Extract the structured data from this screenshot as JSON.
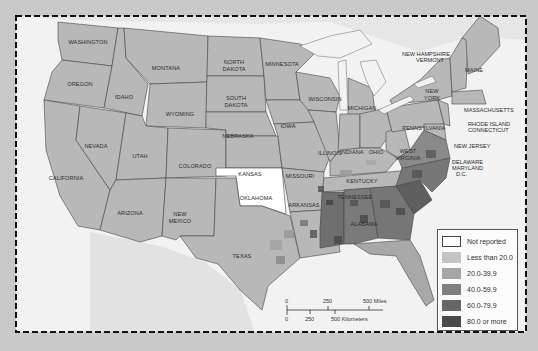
{
  "map": {
    "title": "",
    "background_color": "#c9c9c9",
    "water_color": "#f2f2f2",
    "state_fill": "#b8b8b8",
    "not_reported_fill": "#ffffff",
    "states": {
      "washington": "WASHINGTON",
      "oregon": "OREGON",
      "california": "CALIFORNIA",
      "idaho": "IDAHO",
      "nevada": "NEVADA",
      "montana": "MONTANA",
      "wyoming": "WYOMING",
      "utah": "UTAH",
      "arizona": "ARIZONA",
      "colorado": "COLORADO",
      "new_mexico_1": "NEW",
      "new_mexico_2": "MEXICO",
      "north_dakota_1": "NORTH",
      "north_dakota_2": "DAKOTA",
      "south_dakota_1": "SOUTH",
      "south_dakota_2": "DAKOTA",
      "nebraska": "NEBRASKA",
      "kansas": "KANSAS",
      "oklahoma": "OKLAHOMA",
      "texas": "TEXAS",
      "minnesota": "MINNESOTA",
      "iowa": "IOWA",
      "missouri": "MISSOURI",
      "arkansas": "ARKANSAS",
      "louisiana": "LOUISIANA",
      "wisconsin": "WISCONSIN",
      "illinois": "ILLINOIS",
      "michigan": "MICHIGAN",
      "indiana": "INDIANA",
      "ohio": "OHIO",
      "kentucky": "KENTUCKY",
      "tennessee": "TENNESSEE",
      "mississippi": "MISSISSIPPI",
      "alabama": "ALABAMA",
      "georgia": "GEORGIA",
      "florida": "FLORIDA",
      "south_carolina": "SOUTH CAROLINA",
      "north_carolina_1": "NORTH",
      "north_carolina_2": "CAROLINA",
      "virginia": "VIRGINIA",
      "west_virginia_1": "WEST",
      "west_virginia_2": "VIRGINIA",
      "pennsylvania": "PENNSYLVANIA",
      "new_york_1": "NEW",
      "new_york_2": "YORK",
      "maine": "MAINE"
    },
    "callouts": {
      "new_hampshire": "NEW HAMPSHIRE",
      "vermont": "VERMONT",
      "massachusetts": "MASSACHUSETTS",
      "rhode_island": "RHODE ISLAND",
      "connecticut": "CONNECTICUT",
      "new_jersey": "NEW JERSEY",
      "delaware": "DELAWARE",
      "maryland": "MARYLAND",
      "dc": "D.C."
    }
  },
  "legend": {
    "items": [
      {
        "label": "Not reported",
        "color": "#ffffff"
      },
      {
        "label": "Less than 20.0",
        "color": "#c4c4c4"
      },
      {
        "label": "20.0-39.9",
        "color": "#a6a6a6"
      },
      {
        "label": "40.0-59.9",
        "color": "#808080"
      },
      {
        "label": "60.0-79.9",
        "color": "#666666"
      },
      {
        "label": "80.0 or more",
        "color": "#4a4a4a"
      }
    ]
  },
  "scale_bar": {
    "miles_0": "0",
    "miles_250": "250",
    "miles_500": "500 Miles",
    "km_0": "0",
    "km_250": "250",
    "km_500": "500 Kilometers"
  }
}
